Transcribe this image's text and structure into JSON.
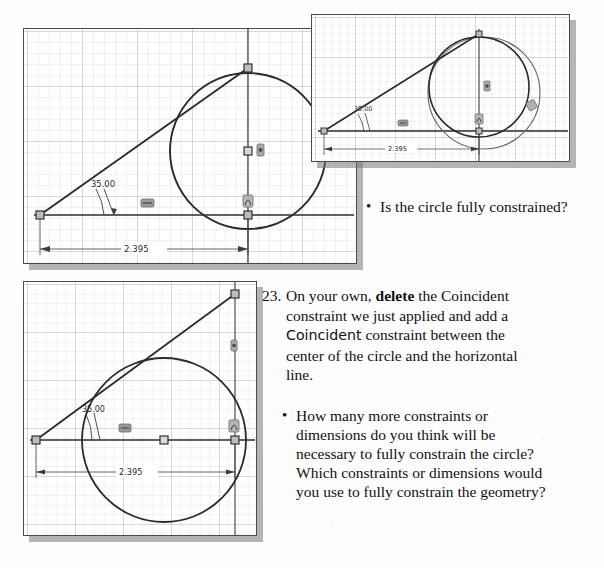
{
  "document": {
    "kind": "textbook-page-excerpt",
    "topic": "sketch constraints tutorial"
  },
  "panels": [
    {
      "id": "top-left-sketch",
      "name": "sketch-view-coincident-applied",
      "dimensions": {
        "angle_label": "35.00",
        "length_label": "2.395"
      },
      "constraint_glyphs": [
        "horizontal",
        "coincident",
        "tangent"
      ],
      "geometry": {
        "circle_count": 1,
        "line_count": 2
      }
    },
    {
      "id": "top-right-inset",
      "name": "sketch-view-dragged-circle",
      "dimensions": {
        "angle_label": "35.00",
        "length_label": "2.395"
      },
      "constraint_glyphs": [
        "horizontal",
        "coincident",
        "tangent"
      ],
      "geometry": {
        "circle_count": 2,
        "line_count": 2
      }
    },
    {
      "id": "bottom-left-sketch",
      "name": "sketch-view-center-coincident",
      "dimensions": {
        "angle_label": "35.00",
        "length_label": "2.395"
      },
      "constraint_glyphs": [
        "horizontal",
        "coincident",
        "tangent"
      ],
      "geometry": {
        "circle_count": 1,
        "line_count": 2
      }
    }
  ],
  "text": {
    "question_1": {
      "bullet": "•",
      "body": "Is the circle fully constrained?"
    },
    "step_23": {
      "number": "23.",
      "seg_1": "On your own, ",
      "seg_2_bold": "delete",
      "seg_3": " the Coincident",
      "line_2": "constraint we just applied and add a",
      "line_3_sans": "Coincident",
      "line_3_rest": " constraint between the",
      "line_4": "center of the circle and the horizontal",
      "line_5": "line."
    },
    "question_2": {
      "bullet": "•",
      "line_1": "How many more constraints or",
      "line_2": "dimensions do you think will be",
      "line_3": "necessary to fully constrain the circle?",
      "line_4": "Which constraints or dimensions would",
      "line_5": "you use to fully constrain the geometry?"
    }
  },
  "colors": {
    "sketch_line": "#2b2b2b",
    "grid_major": "#96a0af",
    "grid_minor": "#c8cfd8",
    "panel_border": "#4a4a4a",
    "shadow": "#989898",
    "dim_line": "#3c3c3c",
    "page_bg": "#ffffff",
    "text": "#111111"
  }
}
